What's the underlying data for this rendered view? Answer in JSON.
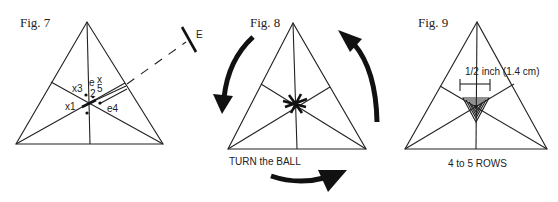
{
  "figures": [
    {
      "id": "fig7",
      "title": "Fig. 7",
      "labels": {
        "x1": "x1",
        "x3": "x3",
        "e2": "e",
        "two": "2",
        "x5": "x",
        "five": "5",
        "e4": "e4",
        "E": "E"
      }
    },
    {
      "id": "fig8",
      "title": "Fig. 8",
      "caption": "TURN the BALL"
    },
    {
      "id": "fig9",
      "title": "Fig. 9",
      "measure": "1/2 inch (1.4 cm)",
      "caption": "4 to 5 ROWS"
    }
  ],
  "colors": {
    "ink": "#222222",
    "background": "#ffffff"
  }
}
